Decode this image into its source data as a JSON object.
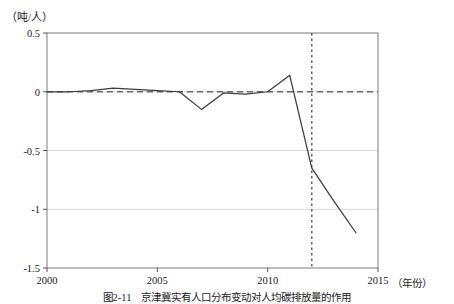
{
  "figure": {
    "unit_label": "（吨/人）",
    "caption": "图2-11　京津冀实有人口分布变动对人均碳排放量的作用",
    "xaxis_unit": "（年份）"
  },
  "chart_data": {
    "type": "line",
    "title": "",
    "subtitle": "",
    "xlabel": "年份",
    "ylabel": "吨/人",
    "xlim": [
      2000,
      2015
    ],
    "ylim": [
      -1.5,
      0.5
    ],
    "xticks": [
      2000,
      2005,
      2010,
      2015
    ],
    "yticks": [
      0.5,
      0,
      -0.5,
      -1,
      -1.5
    ],
    "xtick_labels": [
      "2000",
      "2005",
      "2010",
      "2015"
    ],
    "ytick_labels": [
      "0.5",
      "0",
      "-0.5",
      "-1",
      "-1.5"
    ],
    "grid": "horizontal-light",
    "legend": "none",
    "annotations": [
      {
        "name": "zero-reference-line",
        "type": "hline",
        "y": 0,
        "style": "dashed"
      },
      {
        "name": "policy-year-marker",
        "type": "vline",
        "x": 2012,
        "style": "dotted"
      }
    ],
    "series": [
      {
        "name": "人均碳排放变动",
        "color": "#3c3c3c",
        "x": [
          2000,
          2001,
          2002,
          2003,
          2004,
          2005,
          2006,
          2007,
          2008,
          2009,
          2010,
          2011,
          2012,
          2013,
          2014
        ],
        "values": [
          0.0,
          0.0,
          0.01,
          0.03,
          0.02,
          0.01,
          0.0,
          -0.15,
          -0.01,
          -0.02,
          0.0,
          0.14,
          -0.65,
          -0.93,
          -1.2
        ]
      }
    ]
  }
}
